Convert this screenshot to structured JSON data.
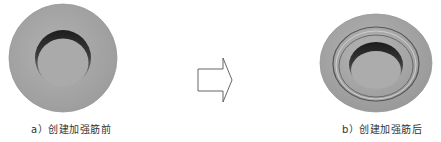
{
  "figure": {
    "left": {
      "label": "a）创建加强筋前",
      "description": "disc-with-recess-before-rib"
    },
    "arrow": {
      "description": "hollow-right-arrow"
    },
    "right": {
      "label": "b）创建加强筋后",
      "description": "disc-with-recess-and-rib-ring-after"
    },
    "colors": {
      "disc_face": "#a8a8a8",
      "disc_edge": "#8c8c8c",
      "hole_shadow": "#2a2a2a",
      "hole_floor": "#b0b0b0",
      "arrow_stroke": "#555555",
      "caption_text": "#333333"
    }
  }
}
